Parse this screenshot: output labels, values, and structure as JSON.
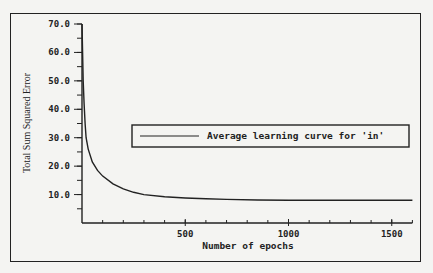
{
  "chart_data": {
    "type": "line",
    "title": "",
    "xlabel": "Number of epochs",
    "ylabel": "Total Sum Squared Error",
    "xlim": [
      0,
      1600
    ],
    "ylim": [
      0,
      70
    ],
    "x_ticks": [
      500,
      1000,
      1500
    ],
    "x_tick_labels": [
      "500",
      "1000",
      "1500"
    ],
    "x_minor_step": 100,
    "y_ticks": [
      10,
      20,
      30,
      40,
      50,
      60,
      70
    ],
    "y_tick_labels": [
      "10.0",
      "20.0",
      "30.0",
      "40.0",
      "50.0",
      "60.0",
      "70.0"
    ],
    "y_minor_step": 5,
    "grid": false,
    "legend_position": "center-right",
    "series": [
      {
        "name": "Average learning curve for 'in'",
        "color": "#222222",
        "x": [
          0,
          3,
          6,
          10,
          15,
          20,
          30,
          50,
          75,
          100,
          150,
          200,
          250,
          300,
          400,
          500,
          600,
          700,
          850,
          1000,
          1200,
          1400,
          1600
        ],
        "values": [
          70,
          60,
          50,
          42,
          35,
          30,
          26,
          21.5,
          18.5,
          16.5,
          13.8,
          12,
          10.8,
          10,
          9.2,
          8.8,
          8.5,
          8.3,
          8.1,
          8.0,
          8.0,
          8.0,
          8.0
        ]
      }
    ]
  }
}
